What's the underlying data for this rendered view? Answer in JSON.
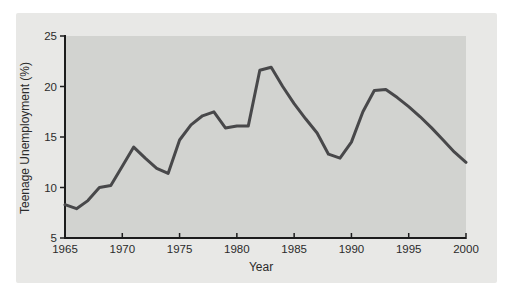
{
  "figure": {
    "background": "#ffffff",
    "panel_background": "#e8e8e6",
    "plot_background": "#d2d3d0",
    "axis_color": "#1c1c1c",
    "text_color": "#2b2b2b"
  },
  "chart_data": {
    "type": "line",
    "title": "",
    "xlabel": "Year",
    "ylabel": "Teenage Unemployment (%)",
    "xlim": [
      1965,
      2000
    ],
    "ylim": [
      5,
      25
    ],
    "x_ticks": [
      1965,
      1970,
      1975,
      1980,
      1985,
      1990,
      1995,
      2000
    ],
    "y_ticks": [
      5,
      10,
      15,
      20,
      25
    ],
    "grid": false,
    "legend": "none",
    "line_color": "#48484a",
    "line_width": 3,
    "series": [
      {
        "name": "Teenage Unemployment (%)",
        "x": [
          1965,
          1966,
          1967,
          1968,
          1969,
          1970,
          1971,
          1972,
          1973,
          1974,
          1975,
          1976,
          1977,
          1978,
          1979,
          1980,
          1981,
          1982,
          1983,
          1984,
          1985,
          1986,
          1987,
          1988,
          1989,
          1990,
          1991,
          1992,
          1993,
          1994,
          1995,
          1996,
          1997,
          1998,
          1999,
          2000
        ],
        "values": [
          8.3,
          7.9,
          8.7,
          10.0,
          10.2,
          12.1,
          14.0,
          12.9,
          11.9,
          11.4,
          14.7,
          16.2,
          17.1,
          17.5,
          15.9,
          16.1,
          16.1,
          21.6,
          21.9,
          20.0,
          18.3,
          16.8,
          15.4,
          13.3,
          12.9,
          14.5,
          17.5,
          19.6,
          19.7,
          18.9,
          18.0,
          17.0,
          15.9,
          14.7,
          13.5,
          12.5
        ]
      }
    ]
  }
}
